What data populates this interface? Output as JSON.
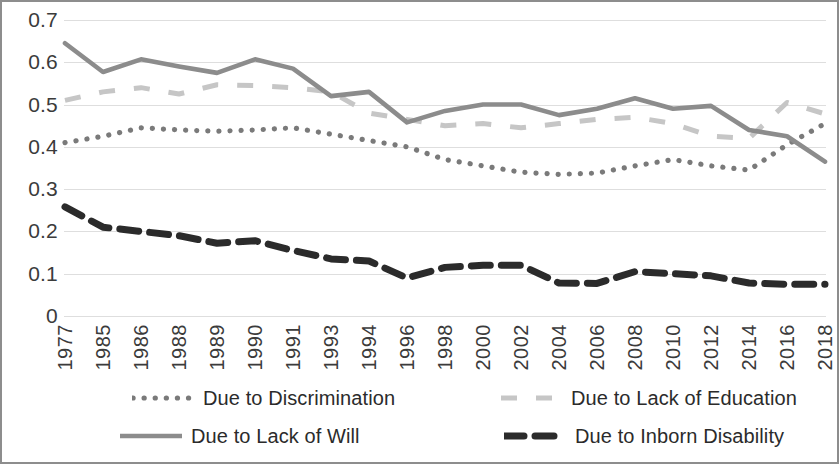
{
  "chart_data": {
    "type": "line",
    "title": "",
    "subtitle": "",
    "xlabel": "",
    "ylabel": "",
    "grid": true,
    "legend_position": "bottom",
    "ylim": [
      0,
      0.7
    ],
    "ytick_labels": [
      "0.7",
      "0.6",
      "0.5",
      "0.4",
      "0.3",
      "0.2",
      "0.1",
      "0"
    ],
    "ytick_values": [
      0.7,
      0.6,
      0.5,
      0.4,
      0.3,
      0.2,
      0.1,
      0
    ],
    "categories": [
      "1977",
      "1985",
      "1986",
      "1988",
      "1989",
      "1990",
      "1991",
      "1993",
      "1994",
      "1996",
      "1998",
      "2000",
      "2002",
      "2004",
      "2006",
      "2008",
      "2010",
      "2012",
      "2014",
      "2016",
      "2018"
    ],
    "series": [
      {
        "name": "Due to Discrimination",
        "style": "dotted",
        "color": "#7a7a7a",
        "values": [
          0.41,
          0.425,
          0.445,
          0.44,
          0.437,
          0.44,
          0.445,
          0.43,
          0.415,
          0.4,
          0.37,
          0.355,
          0.34,
          0.335,
          0.338,
          0.355,
          0.37,
          0.355,
          0.345,
          0.405,
          0.455
        ]
      },
      {
        "name": "Due to Lack of Education",
        "style": "dashed-light",
        "color": "#c6c6c6",
        "values": [
          0.51,
          0.53,
          0.54,
          0.525,
          0.547,
          0.545,
          0.54,
          0.53,
          0.48,
          0.465,
          0.45,
          0.455,
          0.445,
          0.455,
          0.465,
          0.47,
          0.455,
          0.425,
          0.42,
          0.505,
          0.478
        ]
      },
      {
        "name": "Due to Lack of Will",
        "style": "solid",
        "color": "#8c8c8c",
        "values": [
          0.645,
          0.577,
          0.607,
          0.59,
          0.575,
          0.607,
          0.585,
          0.52,
          0.53,
          0.458,
          0.485,
          0.5,
          0.5,
          0.475,
          0.49,
          0.515,
          0.49,
          0.497,
          0.44,
          0.425,
          0.365
        ]
      },
      {
        "name": "Due to Inborn Disability",
        "style": "dashed-bold",
        "color": "#2b2b2b",
        "values": [
          0.258,
          0.21,
          0.2,
          0.19,
          0.172,
          0.178,
          0.155,
          0.135,
          0.13,
          0.09,
          0.115,
          0.12,
          0.12,
          0.078,
          0.077,
          0.105,
          0.1,
          0.095,
          0.078,
          0.075,
          0.075
        ]
      }
    ]
  },
  "legend": {
    "items": [
      {
        "label": "Due to Discrimination"
      },
      {
        "label": "Due to Lack of Education"
      },
      {
        "label": "Due to Lack of Will"
      },
      {
        "label": "Due to Inborn Disability"
      }
    ]
  },
  "colors": {
    "border": "#8d8d8d",
    "gridline": "#dedede",
    "background": "#ffffff",
    "text": "#3b3b3b"
  }
}
